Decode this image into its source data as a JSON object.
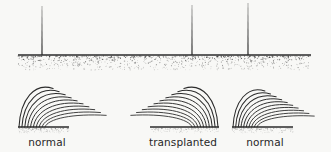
{
  "figure": {
    "name": "bristle-transplant-diagram",
    "background_color": "#f8f8f6",
    "ink_color": "#2b2b2b",
    "width": 331,
    "height": 152,
    "upper_panel": {
      "name": "macrochaete-row",
      "ground_line": {
        "x1": 18,
        "x2": 311,
        "y": 55,
        "thickness": 1.6
      },
      "stipple": {
        "description": "dotted cuticle texture band below ground line",
        "y_top": 56,
        "y_bottom": 70,
        "dot_count": 900,
        "color": "#3a3a3a"
      },
      "bristles": [
        {
          "name": "bristle-left",
          "x": 42,
          "y_top": 6,
          "y_base": 55
        },
        {
          "name": "bristle-middle",
          "x": 192,
          "y_top": 5,
          "y_base": 55
        },
        {
          "name": "bristle-right",
          "x": 248,
          "y_top": 3,
          "y_base": 55
        }
      ]
    },
    "lower_panel": {
      "name": "hair-tufts-row",
      "tufts": [
        {
          "id": "tuft-left",
          "label": "normal",
          "label_x": 47,
          "label_y": 136,
          "orientation": "right",
          "base": {
            "x1": 18,
            "x2": 69,
            "y": 127
          },
          "hair_count": 10,
          "hair_length": 62,
          "root_spread": 26
        },
        {
          "id": "tuft-middle",
          "label": "transplanted",
          "label_x": 183,
          "label_y": 136,
          "orientation": "left",
          "base": {
            "x1": 150,
            "x2": 219,
            "y": 127
          },
          "hair_count": 10,
          "hair_length": 62,
          "root_spread": 26
        },
        {
          "id": "tuft-right",
          "label": "normal",
          "label_x": 265,
          "label_y": 136,
          "orientation": "right",
          "base": {
            "x1": 232,
            "x2": 293,
            "y": 127
          },
          "hair_count": 10,
          "hair_length": 58,
          "root_spread": 24
        }
      ]
    }
  }
}
